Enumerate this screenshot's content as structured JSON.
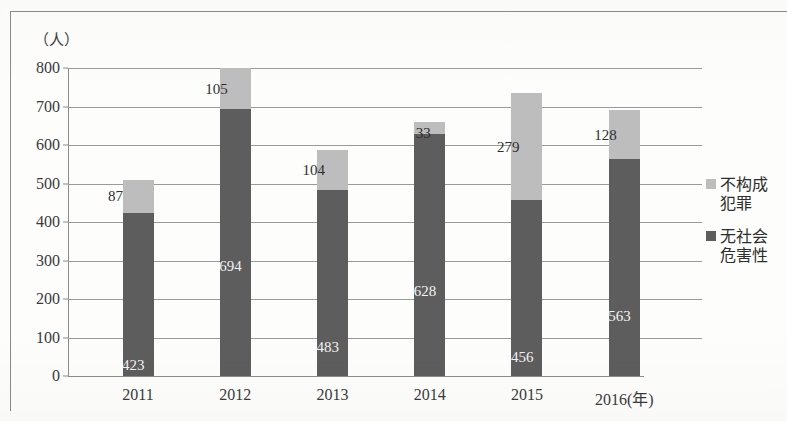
{
  "chart_data": {
    "type": "bar",
    "subtype": "stacked-column",
    "title": "",
    "xlabel": "(年)",
    "ylabel": "（人）",
    "ylim": [
      0,
      800
    ],
    "ytick_step": 100,
    "yticks": [
      "0",
      "100",
      "200",
      "300",
      "400",
      "500",
      "600",
      "700",
      "800"
    ],
    "grid": true,
    "legend_position": "right",
    "categories": [
      "2011",
      "2012",
      "2013",
      "2014",
      "2015",
      "2016"
    ],
    "x_axis_last_label": "2016(年)",
    "series": [
      {
        "name": "无社会危害性",
        "color": "#5d5d5d",
        "stack_order": 0,
        "values": [
          423,
          694,
          483,
          628,
          456,
          563
        ]
      },
      {
        "name": "不构成犯罪",
        "color": "#bdbdbd",
        "stack_order": 1,
        "values": [
          87,
          105,
          104,
          33,
          279,
          128
        ]
      }
    ],
    "totals": [
      510,
      799,
      587,
      661,
      735,
      691
    ]
  },
  "y_unit_caption": "（人）",
  "legend": {
    "items": [
      {
        "label_line1": "不构成",
        "label_line2": "犯罪",
        "color": "#bdbdbd"
      },
      {
        "label_line1": "无社会",
        "label_line2": "危害性",
        "color": "#5d5d5d"
      }
    ]
  },
  "x_labels": [
    "2011",
    "2012",
    "2013",
    "2014",
    "2015",
    "2016(年)"
  ],
  "colors": {
    "dark_segment": "#5d5d5d",
    "light_segment": "#bdbdbd",
    "gridline": "#9a9a9a",
    "axis": "#8c8c8c",
    "text": "#3a3a3a",
    "background": "#fdfdfc"
  }
}
